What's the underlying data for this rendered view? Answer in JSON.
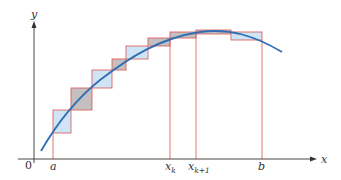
{
  "diagram": {
    "type": "riemann-sum-illustration",
    "axes": {
      "x_label": "x",
      "y_label": "y",
      "origin_label": "0"
    },
    "ticks": {
      "a": "a",
      "x_k": "x",
      "x_k_sub": "k",
      "x_k1": "x",
      "x_k1_sub": "k+1",
      "b": "b"
    },
    "colors": {
      "curve": "#2f6eb5",
      "rect_edge": "#d9534f",
      "fill_under": "#cfe4f5",
      "fill_over": "#c4c0c2",
      "axis": "#333333"
    }
  }
}
